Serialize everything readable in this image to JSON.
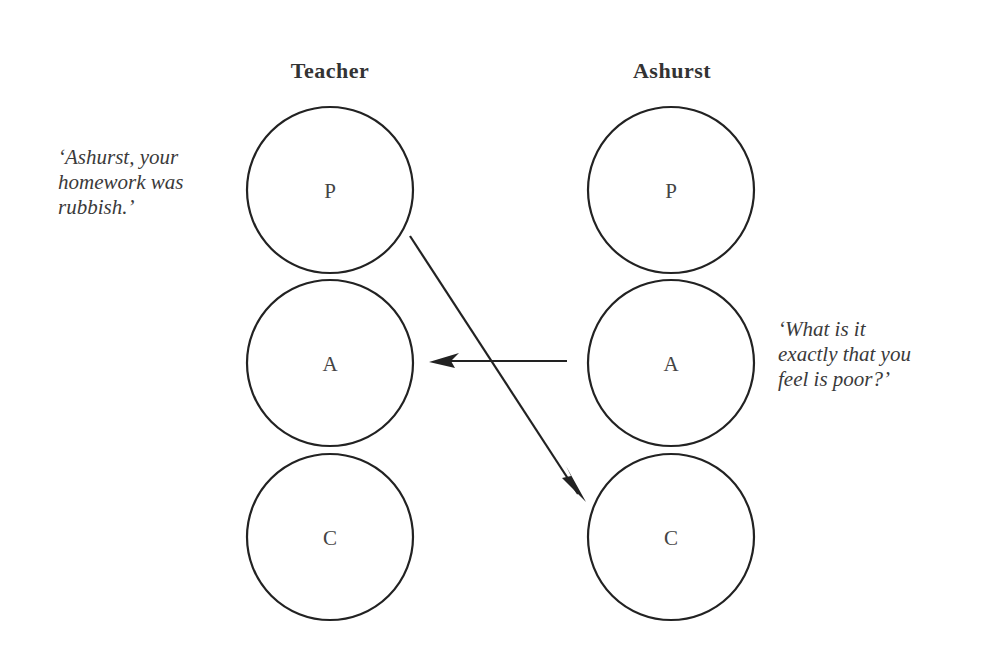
{
  "diagram": {
    "type": "transactional-analysis-crossed-transaction",
    "columns": [
      {
        "title": "Teacher",
        "center_x": 330,
        "states": [
          {
            "label": "P",
            "cy": 190
          },
          {
            "label": "A",
            "cy": 363
          },
          {
            "label": "C",
            "cy": 537
          }
        ]
      },
      {
        "title": "Ashurst",
        "center_x": 671,
        "states": [
          {
            "label": "P",
            "cy": 190
          },
          {
            "label": "A",
            "cy": 363
          },
          {
            "label": "C",
            "cy": 537
          }
        ]
      }
    ],
    "circle_radius": 83,
    "quotes": {
      "teacher": {
        "lines": [
          "‘Ashurst, your",
          "homework was",
          "rubbish.’"
        ]
      },
      "ashurst": {
        "lines": [
          "‘What is it",
          "exactly that you",
          "feel is poor?’"
        ]
      }
    },
    "arrows": [
      {
        "from": "Teacher.P",
        "to": "Ashurst.C",
        "description": "Parent to Child stimulus"
      },
      {
        "from": "Ashurst.A",
        "to": "Teacher.A",
        "description": "Adult to Adult response"
      }
    ],
    "colors": {
      "stroke": "#222222",
      "text": "#333333",
      "background": "#ffffff"
    }
  }
}
